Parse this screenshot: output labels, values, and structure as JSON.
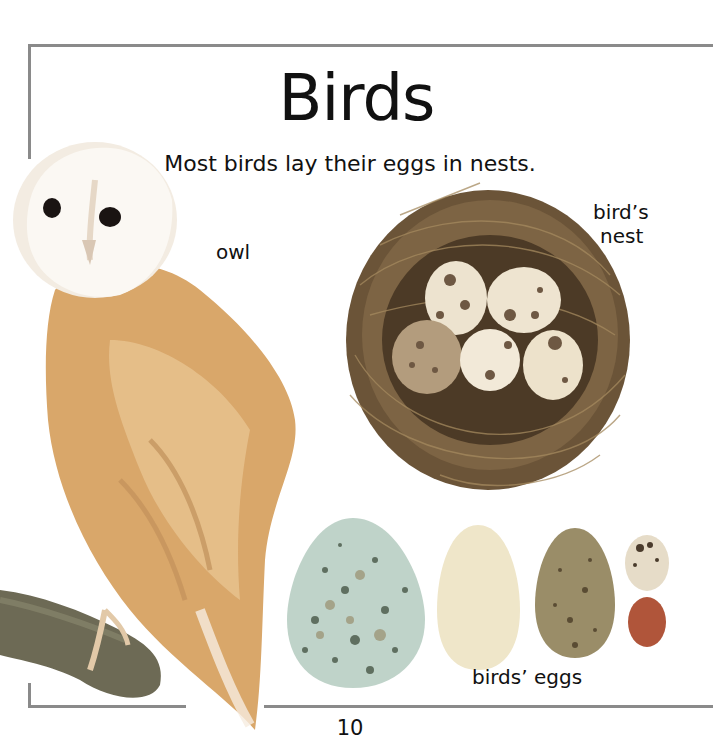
{
  "page": {
    "title": "Birds",
    "subtitle": "Most birds lay their eggs in nests.",
    "page_number": "10"
  },
  "labels": {
    "owl": "owl",
    "nest_line1": "bird’s",
    "nest_line2": "nest",
    "eggs": "birds’ eggs"
  },
  "images": {
    "owl": "barn-owl-on-branch",
    "nest": "birds-nest-with-five-speckled-eggs",
    "eggs": [
      "large-blue-green-speckled-egg",
      "cream-egg",
      "olive-brown-speckled-egg",
      "small-speckled-egg",
      "small-red-brown-egg"
    ]
  },
  "colors": {
    "frame": "#8a8a8a",
    "text": "#111111",
    "owl_face": "#fbf7f0",
    "owl_body": "#d9a76a",
    "nest": "#6b5438",
    "egg_blue": "#b9cfc4",
    "egg_cream": "#f0e6c8",
    "egg_olive": "#9a8c66",
    "egg_red": "#b0553a"
  }
}
